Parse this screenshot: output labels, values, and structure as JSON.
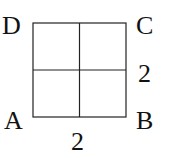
{
  "diagram": {
    "type": "square-grid",
    "vertices": {
      "top_left": "D",
      "top_right": "C",
      "bottom_right": "B",
      "bottom_left": "A"
    },
    "side_labels": {
      "bottom": "2",
      "right": "2"
    },
    "grid": "2x2",
    "line_color": "#222222"
  }
}
